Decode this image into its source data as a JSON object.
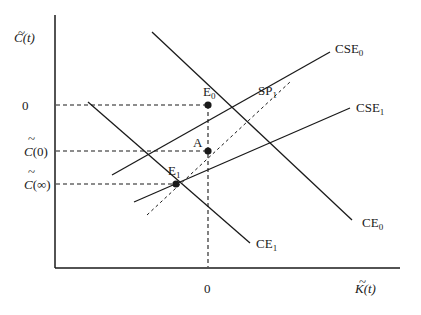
{
  "diagram": {
    "y_axis_label": {
      "base": "C",
      "arg": "(t)"
    },
    "x_axis_label": {
      "base": "K",
      "arg": "(t)"
    },
    "y_ticks": [
      {
        "id": "zero",
        "text": "0"
      },
      {
        "id": "c0",
        "base": "C",
        "arg": "(0)"
      },
      {
        "id": "cinf",
        "base": "C",
        "arg": "(∞)"
      }
    ],
    "x_ticks": [
      {
        "id": "zero",
        "text": "0"
      }
    ],
    "curves": [
      {
        "id": "CSE0",
        "label": "CSE",
        "sub": "0",
        "style": "solid"
      },
      {
        "id": "CSE1",
        "label": "CSE",
        "sub": "1",
        "style": "solid"
      },
      {
        "id": "CE0",
        "label": "CE",
        "sub": "0",
        "style": "solid"
      },
      {
        "id": "CE1",
        "label": "CE",
        "sub": "1",
        "style": "solid"
      },
      {
        "id": "SP1",
        "label": "SP",
        "sub": "1",
        "style": "dashed"
      }
    ],
    "points": [
      {
        "id": "E0",
        "label": "E",
        "sub": "0"
      },
      {
        "id": "A",
        "label": "A"
      },
      {
        "id": "E1",
        "label": "E",
        "sub": "1"
      }
    ],
    "colors": {
      "line": "#1a1a1a",
      "background": "#ffffff"
    }
  }
}
